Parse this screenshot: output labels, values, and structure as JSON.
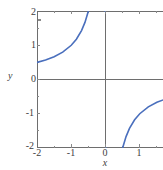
{
  "chart_data": {
    "type": "line",
    "title": "",
    "subtitle": "",
    "xlabel": "x",
    "ylabel": "y",
    "xlim": [
      -2,
      2
    ],
    "ylim": [
      -2,
      2
    ],
    "grid": false,
    "legend": null,
    "annotations": [],
    "axis_style": "origin-crossing axes inside a bounding frame",
    "xticks": [
      -2,
      -1,
      0,
      1,
      2
    ],
    "xtick_labels": [
      "-2",
      "-1",
      "0",
      "1",
      "2"
    ],
    "yticks": [
      -2,
      -1,
      0,
      1,
      2
    ],
    "ytick_labels": [
      "-2",
      "-1",
      "0",
      "1",
      "2"
    ],
    "xminor_step": 0.5,
    "yminor_step": 0.5,
    "series": [
      {
        "name": "y = -1/x",
        "color": "#4a6fbd",
        "linewidth": 1.6,
        "asymptotes": {
          "vertical": [
            0
          ],
          "horizontal": [
            0
          ]
        },
        "branches": [
          {
            "name": "left-branch",
            "x": [
              -2.0,
              -1.75,
              -1.5,
              -1.25,
              -1.0,
              -0.85,
              -0.7,
              -0.6,
              -0.5,
              -0.4,
              -0.35,
              -0.3,
              -0.25,
              -0.2,
              -0.15,
              -0.1,
              -0.05
            ],
            "y": [
              0.5,
              0.571,
              0.667,
              0.8,
              1.0,
              1.176,
              1.429,
              1.667,
              2.0,
              2.5,
              2.857,
              3.333,
              4.0,
              5.0,
              6.667,
              10.0,
              20.0
            ]
          },
          {
            "name": "right-branch",
            "x": [
              0.05,
              0.1,
              0.15,
              0.2,
              0.25,
              0.3,
              0.35,
              0.4,
              0.5,
              0.6,
              0.7,
              0.85,
              1.0,
              1.25,
              1.5,
              1.75,
              2.0
            ],
            "y": [
              -20.0,
              -10.0,
              -6.667,
              -5.0,
              -4.0,
              -3.333,
              -2.857,
              -2.5,
              -2.0,
              -1.667,
              -1.429,
              -1.176,
              -1.0,
              -0.8,
              -0.667,
              -0.571,
              -0.5
            ]
          }
        ]
      }
    ],
    "colors": {
      "curve": "#4a6fbd",
      "axis": "#6e6e6e",
      "tick": "#8a8a8a",
      "text": "#3d3d3d",
      "background": "#ffffff"
    }
  },
  "labels": {
    "x_axis_name": "x",
    "y_axis_name": "y",
    "y_tick_2": "2",
    "y_tick_1": "1",
    "y_tick_0": "0",
    "y_tick_m1": "-1",
    "y_tick_m2": "-2",
    "x_tick_m2": "-2",
    "x_tick_m1": "-1",
    "x_tick_0": "0",
    "x_tick_1": "1",
    "x_tick_2": "2"
  }
}
